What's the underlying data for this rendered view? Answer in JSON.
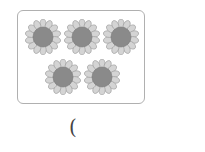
{
  "figure": {
    "flower_count": 5,
    "flowers": [
      {
        "cx": 43,
        "cy": 37
      },
      {
        "cx": 82,
        "cy": 37
      },
      {
        "cx": 121,
        "cy": 37
      },
      {
        "cx": 63,
        "cy": 77
      },
      {
        "cx": 102,
        "cy": 77
      }
    ],
    "colors": {
      "petal": "#d4d4d4",
      "petal_stroke": "#999999",
      "center": "#8a8a8a",
      "border": "#b0b0b0"
    }
  },
  "answer": {
    "open_paren": "("
  }
}
